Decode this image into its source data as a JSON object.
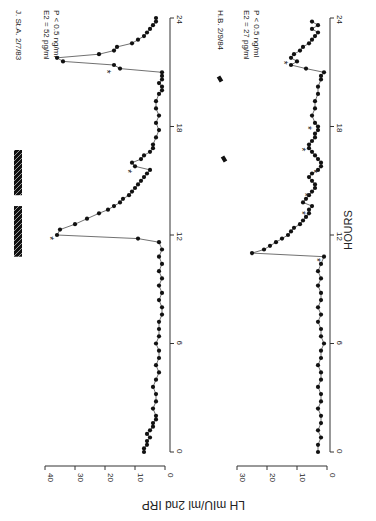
{
  "figure": {
    "ylabel": "LH  mIU/ml  2nd IRP",
    "xlabel": "HOURS",
    "rotation": "90deg clockwise"
  },
  "chart_data": [
    {
      "type": "scatter",
      "title": "J. St.A. 2/7/83",
      "annotations": [
        "E2 = 52 pg/ml",
        "P  < 0.5 ng/ml"
      ],
      "xlabel": "HOURS",
      "ylabel": "LH mIU/ml 2nd IRP",
      "xlim": [
        0,
        24
      ],
      "ylim": [
        0,
        40
      ],
      "xticks": [
        0,
        6,
        12,
        18,
        24
      ],
      "yticks": [
        0,
        10,
        20,
        30,
        40
      ],
      "grid": false,
      "connected": true,
      "pulse_markers_hours": [
        12.1,
        15.8,
        21.3
      ],
      "hatched_bars": [
        {
          "start": 10.8,
          "end": 13.6
        },
        {
          "start": 14.2,
          "end": 16.7
        }
      ],
      "series": [
        {
          "name": "LH",
          "x": [
            0.0,
            0.2,
            0.4,
            0.6,
            0.8,
            1.0,
            1.2,
            1.4,
            1.6,
            1.8,
            2.0,
            2.4,
            2.8,
            3.2,
            3.6,
            4.0,
            4.4,
            4.8,
            5.2,
            5.6,
            6.0,
            6.4,
            6.8,
            7.2,
            7.6,
            8.0,
            8.4,
            8.8,
            9.2,
            9.6,
            10.0,
            10.4,
            10.8,
            11.2,
            11.6,
            11.8,
            12.0,
            12.3,
            12.6,
            12.9,
            13.2,
            13.4,
            13.6,
            13.8,
            14.0,
            14.2,
            14.4,
            14.6,
            14.8,
            15.0,
            15.2,
            15.4,
            15.6,
            15.8,
            16.0,
            16.2,
            16.4,
            16.6,
            16.8,
            17.0,
            17.4,
            17.8,
            18.2,
            18.6,
            19.0,
            19.4,
            19.8,
            20.0,
            20.2,
            20.4,
            20.6,
            20.8,
            21.0,
            21.2,
            21.4,
            21.6,
            21.8,
            22.0,
            22.2,
            22.4,
            22.6,
            22.8,
            23.0,
            23.2,
            23.4,
            23.6,
            23.8,
            24.0
          ],
          "values": [
            7,
            7,
            6,
            6,
            5,
            6,
            5,
            4,
            4,
            3,
            3,
            4,
            3,
            3,
            4,
            3,
            2,
            3,
            2,
            2,
            3,
            2,
            2,
            2,
            1,
            1,
            2,
            1,
            2,
            1,
            2,
            1,
            2,
            1,
            2,
            9,
            36,
            35,
            30,
            26,
            22,
            19,
            17,
            15,
            14,
            12,
            11,
            10,
            9,
            8,
            7,
            6,
            5,
            10,
            11,
            8,
            7,
            5,
            4,
            4,
            3,
            2,
            3,
            2,
            3,
            3,
            2,
            1,
            1,
            2,
            1,
            1,
            1,
            15,
            17,
            34,
            36,
            22,
            17,
            16,
            11,
            9,
            7,
            6,
            5,
            4,
            3,
            3,
            3,
            3
          ]
        }
      ]
    },
    {
      "type": "scatter",
      "title": "H.B. 2/9/84",
      "annotations": [
        "E2 = 27 pg/ml",
        "P  < 0.5 ng/ml"
      ],
      "xlabel": "HOURS",
      "ylabel": "LH mIU/ml 2nd IRP",
      "xlim": [
        0,
        24
      ],
      "ylim": [
        0,
        30
      ],
      "xticks": [
        0,
        6,
        12,
        18,
        24
      ],
      "yticks": [
        0,
        10,
        20,
        30
      ],
      "grid": false,
      "connected": true,
      "pulse_markers_hours": [
        10.9,
        13.5,
        14.5,
        15.8,
        17.0,
        18.2,
        21.8
      ],
      "series": [
        {
          "name": "LH",
          "x": [
            0.0,
            0.4,
            0.8,
            1.2,
            1.6,
            2.0,
            2.4,
            2.8,
            3.2,
            3.6,
            4.0,
            4.4,
            4.8,
            5.2,
            5.6,
            6.0,
            6.4,
            6.8,
            7.2,
            7.6,
            8.0,
            8.4,
            8.8,
            9.2,
            9.6,
            10.0,
            10.4,
            10.8,
            11.0,
            11.2,
            11.4,
            11.6,
            11.8,
            12.0,
            12.2,
            12.4,
            12.6,
            12.8,
            13.0,
            13.2,
            13.4,
            13.6,
            13.8,
            14.0,
            14.2,
            14.4,
            14.6,
            14.8,
            15.0,
            15.2,
            15.4,
            15.6,
            15.8,
            16.0,
            16.2,
            16.4,
            16.6,
            16.8,
            17.0,
            17.2,
            17.4,
            17.6,
            17.8,
            18.0,
            18.2,
            18.6,
            19.0,
            19.4,
            19.8,
            20.2,
            20.6,
            20.8,
            21.0,
            21.2,
            21.4,
            21.6,
            21.8,
            22.0,
            22.2,
            22.4,
            22.6,
            22.8,
            23.0,
            23.2,
            23.4,
            23.6,
            23.8
          ],
          "values": [
            3,
            3,
            2,
            3,
            2,
            2,
            3,
            2,
            2,
            3,
            2,
            2,
            3,
            2,
            2,
            1,
            2,
            2,
            3,
            2,
            3,
            2,
            2,
            3,
            2,
            3,
            2,
            1,
            25,
            21,
            19,
            17,
            15,
            13,
            12,
            11,
            9,
            8,
            7,
            6,
            6,
            5,
            8,
            7,
            6,
            5,
            4,
            4,
            5,
            6,
            5,
            3,
            2,
            2,
            3,
            4,
            5,
            6,
            6,
            5,
            4,
            4,
            3,
            3,
            4,
            5,
            4,
            4,
            3,
            3,
            2,
            2,
            1,
            7,
            12,
            10,
            12,
            11,
            9,
            8,
            6,
            5,
            4,
            3,
            5,
            3,
            5
          ]
        }
      ]
    }
  ]
}
